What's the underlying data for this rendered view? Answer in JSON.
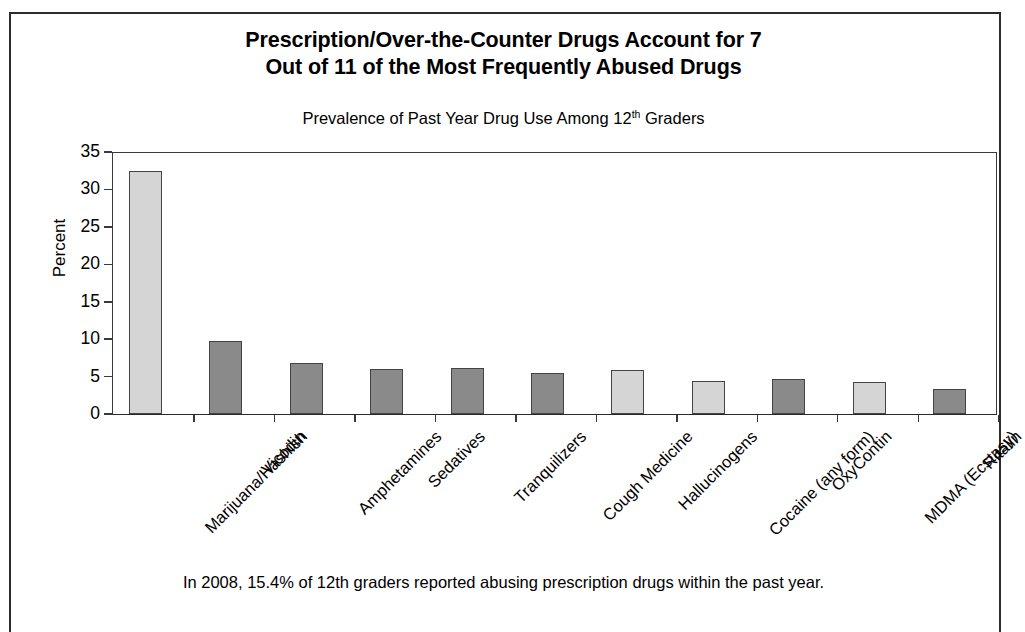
{
  "figure": {
    "title_line1": "Prescription/Over-the-Counter Drugs Account for 7",
    "title_line2": "Out of 11 of the Most Frequently Abused Drugs",
    "subtitle_before": "Prevalence of Past Year Drug Use Among 12",
    "subtitle_sup": "th",
    "subtitle_after": " Graders",
    "footnote": "In 2008, 15.4% of 12th graders reported abusing prescription drugs within the past year."
  },
  "chart_data": {
    "type": "bar",
    "title": "Prescription/Over-the-Counter Drugs Account for 7 Out of 11 of the Most Frequently Abused Drugs",
    "subtitle": "Prevalence of Past Year Drug Use Among 12th Graders",
    "xlabel": "",
    "ylabel": "Percent",
    "ylim": [
      0,
      35
    ],
    "yticks": [
      0,
      5,
      10,
      15,
      20,
      25,
      30,
      35
    ],
    "ytick_labels": [
      "0",
      "5",
      "10",
      "15",
      "20",
      "25",
      "30",
      "35"
    ],
    "grid": false,
    "legend": "none",
    "categories": [
      "Marijuana/Hashish",
      "Vicodin",
      "Amphetamines",
      "Sedatives",
      "Tranquilizers",
      "Cough Medicine",
      "Hallucinogens",
      "Cocaine (any form)",
      "OxyContin",
      "MDMA (Ecstasy)",
      "Ritalin"
    ],
    "values": [
      32.4,
      9.7,
      6.8,
      6.0,
      6.2,
      5.5,
      5.9,
      4.4,
      4.7,
      4.3,
      3.4
    ],
    "bar_shades": [
      "light",
      "dark",
      "dark",
      "dark",
      "dark",
      "dark",
      "light",
      "light",
      "dark",
      "light",
      "dark"
    ],
    "colors": {
      "light": "#d5d5d5",
      "dark": "#8a8a8a",
      "bar_edge": "#444444",
      "axis": "#3a3a3a",
      "frame": "#2c2c2c",
      "text": "#000000"
    }
  }
}
